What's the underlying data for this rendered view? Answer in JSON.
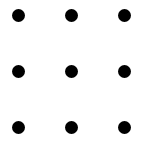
{
  "diagram": {
    "type": "dot-grid",
    "rows": 3,
    "columns": 3,
    "dot_color": "#000000",
    "background_color": "#ffffff",
    "dots": [
      {
        "row": 0,
        "col": 0
      },
      {
        "row": 0,
        "col": 1
      },
      {
        "row": 0,
        "col": 2
      },
      {
        "row": 1,
        "col": 0
      },
      {
        "row": 1,
        "col": 1
      },
      {
        "row": 1,
        "col": 2
      },
      {
        "row": 2,
        "col": 0
      },
      {
        "row": 2,
        "col": 1
      },
      {
        "row": 2,
        "col": 2
      }
    ]
  }
}
